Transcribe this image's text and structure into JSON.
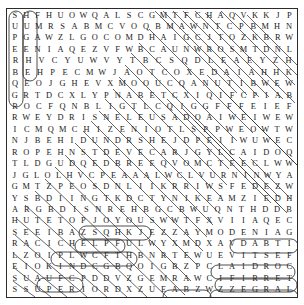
{
  "puzzle": {
    "type": "word-search",
    "columns": 23,
    "rows": 21,
    "border_color": "#2b2b2b",
    "letter_color": "#1a1a1a",
    "mark_color": "#3a3a3a",
    "grid": [
      "SHFHUOWQALSCGMTFCHAQVKKJP",
      "UUMRSABMCVOQBMAWNTCPBMHN",
      "PGAWZLGOCOMDHAIGCJTOZKBRW",
      "EENIAQEZVFWBCAUNWROSMTDNL",
      "RHVCYUWVYTBCSQDLEAEYZH",
      "BEHPECMWJAOTCOXEDAIAHHK",
      "QEOJGHEVXMOOUCQANUTIBWEW",
      "GRTDCXLYPNABETCXIQIFCPIAB",
      "ROCFQNBLIGTLCQIGGFFFEIEF",
      "RWEYDRISNELEUSADOAIWEIWEW",
      "ICMQMCHIZENIOTLSPPWEOWTW",
      "NJBEHIDUNDRSHEJDPEIIWUWEC",
      "ROPEHNSTDEVECARJGYLCAIDOQ",
      "TLDGUDQEDBREEQVOMCTEECLWW",
      "JGLOLHVCPEAAALWCLVURNINWYA",
      "GMTZPEOSDNLIIKRRIWSFEDEZW",
      "YSBDIINGTKDCTYNIKEAMZIEDH",
      "ARGBDISNREHBGCBWUQNTHDDB",
      "HUTETOPJOYOUSWWTFXVIIAQEC",
      "SEEIBAZSQHKJEZZAYMODENIAG",
      "RACICHELPFULWYXMDXAVDABTI",
      "LZOIPLWCFTHBNRTEWUEVITSEF",
      "EIOKINDCGBQOIGBZPCLAIDROC",
      "SUAUFCPDDVZGEMRAWCIFIRRET",
      "SSUPERIORDXZUEABZWZZEGRAL"
    ],
    "found_words": [
      {
        "text": "SUPERB",
        "direction": "vertical-down",
        "circled": true
      },
      {
        "text": "HUGE",
        "direction": "vertical-down",
        "circled": true
      },
      {
        "text": "JOYOUS",
        "direction": "horizontal",
        "circled": true
      },
      {
        "text": "HELPFUL",
        "direction": "horizontal",
        "circled": true
      },
      {
        "text": "KIND",
        "direction": "horizontal",
        "circled": true
      },
      {
        "text": "WARM",
        "direction": "horizontal",
        "circled": true
      },
      {
        "text": "SUPERIOR",
        "direction": "horizontal",
        "circled": true
      },
      {
        "text": "DENIAG",
        "display": "GAINED reversed",
        "direction": "horizontal-reversed",
        "circled": true
      },
      {
        "text": "EVITSEF",
        "display": "FESTIVE reversed",
        "direction": "horizontal-reversed",
        "circled": true
      },
      {
        "text": "LAIDROC",
        "display": "CORDIAL reversed",
        "direction": "horizontal-reversed",
        "circled": true
      },
      {
        "text": "CIFIRRET",
        "display": "TERRIFIC reversed",
        "direction": "horizontal-reversed",
        "circled": true
      },
      {
        "text": "EGRAL",
        "display": "LARGE reversed",
        "direction": "horizontal-reversed",
        "circled": true
      }
    ],
    "strike_lines": [
      {
        "x1": 148,
        "y1": 2,
        "x2": 230,
        "y2": 84
      },
      {
        "x1": 156,
        "y1": 2,
        "x2": 240,
        "y2": 86
      },
      {
        "x1": 166,
        "y1": 2,
        "x2": 252,
        "y2": 88
      },
      {
        "x1": 176,
        "y1": 2,
        "x2": 262,
        "y2": 88
      },
      {
        "x1": 188,
        "y1": 2,
        "x2": 276,
        "y2": 90
      },
      {
        "x1": 198,
        "y1": 4,
        "x2": 288,
        "y2": 94
      },
      {
        "x1": 132,
        "y1": 34,
        "x2": 230,
        "y2": 132
      },
      {
        "x1": 124,
        "y1": 44,
        "x2": 226,
        "y2": 146
      },
      {
        "x1": 118,
        "y1": 56,
        "x2": 222,
        "y2": 160
      },
      {
        "x1": 112,
        "y1": 68,
        "x2": 220,
        "y2": 176
      },
      {
        "x1": 106,
        "y1": 80,
        "x2": 214,
        "y2": 188
      },
      {
        "x1": 98,
        "y1": 90,
        "x2": 210,
        "y2": 202
      },
      {
        "x1": 92,
        "y1": 102,
        "x2": 206,
        "y2": 216
      },
      {
        "x1": 84,
        "y1": 112,
        "x2": 200,
        "y2": 228
      },
      {
        "x1": 76,
        "y1": 122,
        "x2": 196,
        "y2": 242
      },
      {
        "x1": 68,
        "y1": 134,
        "x2": 190,
        "y2": 256
      },
      {
        "x1": 58,
        "y1": 146,
        "x2": 184,
        "y2": 272
      },
      {
        "x1": 48,
        "y1": 158,
        "x2": 178,
        "y2": 286
      },
      {
        "x1": 38,
        "y1": 170,
        "x2": 160,
        "y2": 288
      },
      {
        "x1": 28,
        "y1": 182,
        "x2": 140,
        "y2": 288
      },
      {
        "x1": 18,
        "y1": 196,
        "x2": 120,
        "y2": 288
      },
      {
        "x1": 10,
        "y1": 210,
        "x2": 100,
        "y2": 288
      },
      {
        "x1": 8,
        "y1": 226,
        "x2": 80,
        "y2": 288
      },
      {
        "x1": 6,
        "y1": 244,
        "x2": 60,
        "y2": 288
      },
      {
        "x1": 6,
        "y1": 258,
        "x2": 44,
        "y2": 288
      },
      {
        "x1": 6,
        "y1": 272,
        "x2": 28,
        "y2": 288
      },
      {
        "x1": 214,
        "y1": 2,
        "x2": 288,
        "y2": 76
      },
      {
        "x1": 228,
        "y1": 4,
        "x2": 290,
        "y2": 66
      },
      {
        "x1": 240,
        "y1": 6,
        "x2": 290,
        "y2": 56
      },
      {
        "x1": 142,
        "y1": 20,
        "x2": 246,
        "y2": 124
      },
      {
        "x1": 200,
        "y1": 66,
        "x2": 290,
        "y2": 156
      },
      {
        "x1": 212,
        "y1": 78,
        "x2": 290,
        "y2": 156
      },
      {
        "x1": 224,
        "y1": 90,
        "x2": 290,
        "y2": 156
      },
      {
        "x1": 236,
        "y1": 102,
        "x2": 290,
        "y2": 156
      },
      {
        "x1": 248,
        "y1": 114,
        "x2": 290,
        "y2": 156
      },
      {
        "x1": 176,
        "y1": 100,
        "x2": 274,
        "y2": 198
      },
      {
        "x1": 188,
        "y1": 112,
        "x2": 280,
        "y2": 204
      },
      {
        "x1": 160,
        "y1": 90,
        "x2": 264,
        "y2": 194
      },
      {
        "x1": 232,
        "y1": 148,
        "x2": 272,
        "y2": 188
      },
      {
        "x1": 244,
        "y1": 150,
        "x2": 284,
        "y2": 190
      }
    ],
    "rings": [
      {
        "cx": 9,
        "cy": 50,
        "rx": 7,
        "ry": 48,
        "word": "SUPERB"
      },
      {
        "cx": 23,
        "cy": 37,
        "rx": 7,
        "ry": 35,
        "word": "HUGE"
      },
      {
        "cx": 108,
        "cy": 224,
        "rx": 36,
        "ry": 7,
        "word": "JOYOUS"
      },
      {
        "cx": 93,
        "cy": 237,
        "rx": 25,
        "ry": 7,
        "word": "DENIAG-right"
      },
      {
        "cx": 87,
        "cy": 250,
        "rx": 43,
        "ry": 7,
        "word": "HELPFUL"
      },
      {
        "cx": 257,
        "cy": 237,
        "rx": 34,
        "ry": 7,
        "word": "DENIAG"
      },
      {
        "cx": 246,
        "cy": 263,
        "rx": 42,
        "ry": 7,
        "word": "EVITSEF"
      },
      {
        "cx": 249,
        "cy": 276,
        "rx": 41,
        "ry": 7,
        "word": "LAIDROC"
      },
      {
        "cx": 53,
        "cy": 276,
        "rx": 23,
        "ry": 7,
        "word": "KIND"
      },
      {
        "cx": 180,
        "cy": 288,
        "rx": 24,
        "ry": 7,
        "word": "WARM"
      },
      {
        "cx": 247,
        "cy": 288,
        "rx": 44,
        "ry": 7,
        "word": "CIFIRRET"
      },
      {
        "cx": 52,
        "cy": 300,
        "rx": 48,
        "ry": 7,
        "word": "SUPERIOR"
      },
      {
        "cx": 266,
        "cy": 300,
        "rx": 27,
        "ry": 7,
        "word": "EGRAL"
      }
    ]
  }
}
